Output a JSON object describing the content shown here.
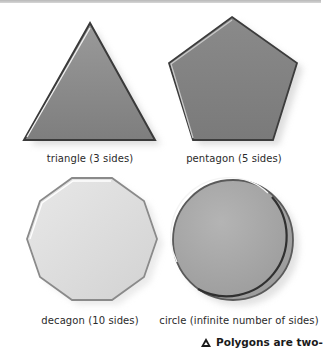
{
  "figure": {
    "shapes": [
      {
        "name": "triangle",
        "label": "triangle (3 sides)",
        "sides": 3,
        "fill": "#8c8c8c"
      },
      {
        "name": "pentagon",
        "label": "pentagon (5 sides)",
        "sides": 5,
        "fill": "#808080"
      },
      {
        "name": "decagon",
        "label": "decagon (10 sides)",
        "sides": 10,
        "fill": "#dcdcdc"
      },
      {
        "name": "circle",
        "label": "circle (infinite number of sides)",
        "sides": "infinite",
        "fill": "#a8a8a8"
      }
    ],
    "caption": {
      "icon": "triangle-icon",
      "text": "Polygons are two-"
    }
  }
}
